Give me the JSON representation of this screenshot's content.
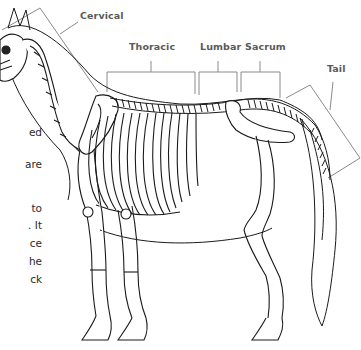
{
  "diagram": {
    "colors": {
      "label_text": "#5a5a5a",
      "bracket_line": "#8a8a8a",
      "outline": "#1a1a1a",
      "body_text": "#2a2a2a"
    },
    "labels": [
      {
        "id": "cervical",
        "text": "Cervical",
        "x": 80,
        "y": 17
      },
      {
        "id": "thoracic",
        "text": "Thoracic",
        "x": 129,
        "y": 48
      },
      {
        "id": "lumbar",
        "text": "Lumbar",
        "x": 200,
        "y": 48
      },
      {
        "id": "sacrum",
        "text": "Sacrum",
        "x": 245,
        "y": 48
      },
      {
        "id": "tail",
        "text": "Tail",
        "x": 327,
        "y": 70
      }
    ]
  },
  "body_text_fragments": [
    {
      "text": "ed",
      "y": 132
    },
    {
      "text": "are",
      "y": 164
    },
    {
      "text": "to",
      "y": 208
    },
    {
      "text": ". It",
      "y": 225
    },
    {
      "text": "ce",
      "y": 243
    },
    {
      "text": "he",
      "y": 261
    },
    {
      "text": "ck",
      "y": 279
    }
  ]
}
